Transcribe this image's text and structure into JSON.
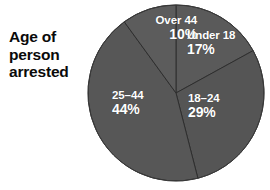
{
  "chart_data": {
    "type": "pie",
    "title": "Age of\nperson\narrested",
    "title_lines": [
      "Age of",
      "person",
      "arrested"
    ],
    "categories": [
      "Under 18",
      "18–24",
      "25–44",
      "Over 44"
    ],
    "values": [
      17,
      29,
      44,
      10
    ],
    "value_labels": [
      "17%",
      "29%",
      "44%",
      "10%"
    ],
    "units": "percent",
    "legend": "none",
    "grid": false,
    "slices": [
      {
        "name": "Under 18",
        "value": 17,
        "value_label": "17%",
        "color": "#5a5a5a",
        "start_angle_deg": 0,
        "end_angle_deg": 61.2
      },
      {
        "name": "18–24",
        "value": 29,
        "value_label": "29%",
        "color": "#555555",
        "start_angle_deg": 61.2,
        "end_angle_deg": 165.6
      },
      {
        "name": "25–44",
        "value": 44,
        "value_label": "44%",
        "color": "#575757",
        "start_angle_deg": 165.6,
        "end_angle_deg": 324.0
      },
      {
        "name": "Over 44",
        "value": 10,
        "value_label": "10%",
        "color": "#5c5c5c",
        "start_angle_deg": 324.0,
        "end_angle_deg": 360.0
      }
    ]
  },
  "colors": {
    "background": "#ffffff",
    "slice_gray": "#575757",
    "slice_divider": "#2e2e2e",
    "title_text": "#0a0a0a",
    "label_text": "#ffffff"
  },
  "geometry": {
    "center_x": 176,
    "center_y": 93,
    "radius": 88
  }
}
